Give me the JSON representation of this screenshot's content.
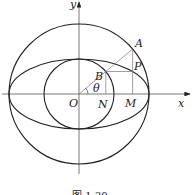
{
  "diagram": {
    "caption": "图 1-20",
    "labels": {
      "y_axis": "y",
      "x_axis": "x",
      "origin": "O",
      "point_a": "A",
      "point_b": "B",
      "point_p": "P",
      "point_n": "N",
      "point_m": "M",
      "angle": "θ"
    },
    "shapes": {
      "large_circle": "circle of radius a centered at O",
      "small_circle": "circle of radius b centered at O",
      "ellipse": "ellipse with semi-axes a and b",
      "ray": "ray from O through B to A at angle θ"
    },
    "colors": {
      "stroke": "#222222",
      "thin_stroke": "#777777"
    }
  }
}
